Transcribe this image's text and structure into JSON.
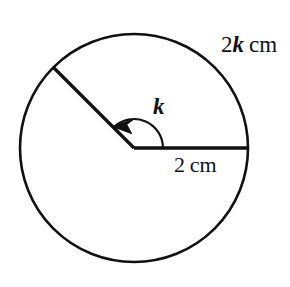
{
  "figure": {
    "stroke_color": "#111111",
    "fill_color": "#ffffff",
    "background": "#ffffff",
    "labels": {
      "arc_length": {
        "number": "2",
        "variable": "k",
        "unit": "cm",
        "full": "2k cm"
      },
      "radius_length": {
        "number": "2",
        "unit": "cm",
        "full": "2 cm"
      },
      "angle": {
        "variable": "k",
        "full": "k"
      }
    },
    "geometry": {
      "circle": {
        "center_x": 134,
        "center_y": 148,
        "radius": 118
      },
      "radius_horizontal": {
        "from_x": 134,
        "from_y": 148,
        "to_x": 252,
        "to_y": 148,
        "angle_deg": 0
      },
      "radius_slanted": {
        "from_x": 134,
        "from_y": 148,
        "to_x": 51,
        "to_y": 64,
        "angle_deg": 135
      },
      "angle_arc": {
        "radius": 29,
        "start_deg": 0,
        "end_deg": 135,
        "direction": "counterclockwise",
        "arrowhead": "end"
      }
    }
  }
}
